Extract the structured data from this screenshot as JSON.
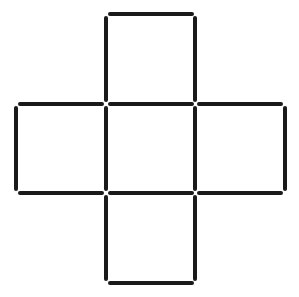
{
  "diagram": {
    "type": "matchstick-puzzle",
    "shape": "cross of five squares",
    "square_count": 5,
    "matchstick_count": 16,
    "stroke_color": "#1a1a1a",
    "background_color": "#ffffff",
    "squares": [
      {
        "name": "top",
        "col": 1,
        "row": 0
      },
      {
        "name": "left",
        "col": 0,
        "row": 1
      },
      {
        "name": "center",
        "col": 1,
        "row": 1
      },
      {
        "name": "right",
        "col": 2,
        "row": 1
      },
      {
        "name": "bottom",
        "col": 1,
        "row": 2
      }
    ]
  }
}
